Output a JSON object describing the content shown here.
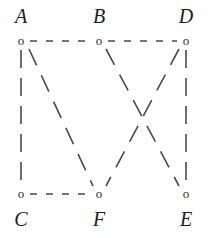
{
  "figure": {
    "background_color": "#ffffff",
    "edge_color": "#4a4a4a",
    "label_color": "#1c1c1c",
    "node_color": "#2b2b2b",
    "node_glyph": "o",
    "width": 210,
    "height": 238
  },
  "nodes": [
    {
      "id": "A",
      "label": "A",
      "x": 21,
      "y": 41,
      "label_x": 21,
      "label_y": 6,
      "label_position": "above"
    },
    {
      "id": "B",
      "label": "B",
      "x": 99,
      "y": 41,
      "label_x": 99,
      "label_y": 6,
      "label_position": "above"
    },
    {
      "id": "D",
      "label": "D",
      "x": 186,
      "y": 41,
      "label_x": 186,
      "label_y": 6,
      "label_position": "above"
    },
    {
      "id": "C",
      "label": "C",
      "x": 21,
      "y": 194,
      "label_x": 21,
      "label_y": 209,
      "label_position": "below"
    },
    {
      "id": "F",
      "label": "F",
      "x": 99,
      "y": 194,
      "label_x": 99,
      "label_y": 209,
      "label_position": "below"
    },
    {
      "id": "E",
      "label": "E",
      "x": 186,
      "y": 194,
      "label_x": 186,
      "label_y": 209,
      "label_position": "below"
    }
  ],
  "edges": [
    {
      "id": "A-B",
      "from": "A",
      "to": "B",
      "x1": 30,
      "y1": 41,
      "x2": 90,
      "y2": 41,
      "style": "dashed",
      "dash": "7 9"
    },
    {
      "id": "B-D",
      "from": "B",
      "to": "D",
      "x1": 108,
      "y1": 41,
      "x2": 177,
      "y2": 41,
      "style": "dashed",
      "dash": "7 9"
    },
    {
      "id": "A-C",
      "from": "A",
      "to": "C",
      "x1": 21,
      "y1": 50,
      "x2": 21,
      "y2": 185,
      "style": "dashed",
      "dash": "18 10"
    },
    {
      "id": "D-E",
      "from": "D",
      "to": "E",
      "x1": 186,
      "y1": 50,
      "x2": 186,
      "y2": 185,
      "style": "dashed",
      "dash": "18 10"
    },
    {
      "id": "C-F",
      "from": "C",
      "to": "F",
      "x1": 30,
      "y1": 194,
      "x2": 90,
      "y2": 194,
      "style": "dashed",
      "dash": "7 9"
    },
    {
      "id": "A-F",
      "from": "A",
      "to": "F",
      "x1": 29,
      "y1": 49,
      "x2": 93,
      "y2": 186,
      "style": "dashed",
      "dash": "18 11"
    },
    {
      "id": "B-E",
      "from": "B",
      "to": "E",
      "x1": 106,
      "y1": 49,
      "x2": 179,
      "y2": 186,
      "style": "dashed",
      "dash": "18 11"
    },
    {
      "id": "D-F",
      "from": "D",
      "to": "F",
      "x1": 179,
      "y1": 49,
      "x2": 106,
      "y2": 186,
      "style": "dashed",
      "dash": "18 11"
    }
  ]
}
